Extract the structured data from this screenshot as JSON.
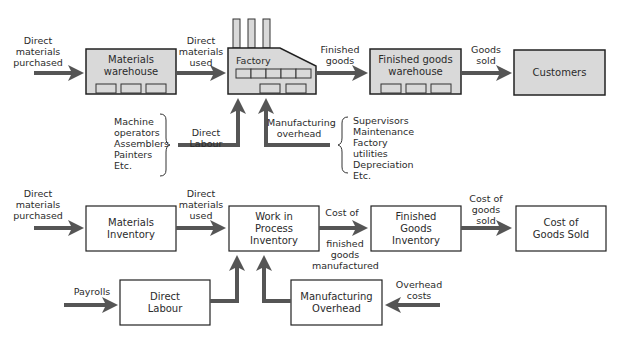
{
  "colors": {
    "arrow": "#555555",
    "box_fill_top": "#d9d9d9",
    "box_stroke": "#222222",
    "box_fill_bottom": "#ffffff"
  },
  "top": {
    "in_label": "Direct\nmaterials\npurchased",
    "materials_warehouse": "Materials\nwarehouse",
    "used_label": "Direct\nmaterials\nused",
    "factory": "Factory",
    "finished_label": "Finished\ngoods",
    "finished_warehouse": "Finished goods\nwarehouse",
    "sold_label": "Goods\nsold",
    "customers": "Customers",
    "labour_items": "Machine\n  operators\nAssemblers\nPainters\nEtc.",
    "direct_labour": "Direct Labour",
    "mfg_overhead": "Manufacturing\noverhead",
    "overhead_items": "Supervisors\nMaintenance\nFactory\n  utilities\nDepreciation\nEtc."
  },
  "bottom": {
    "in_label": "Direct\nmaterials\npurchased",
    "materials_inventory": "Materials\nInventory",
    "used_label": "Direct\nmaterials\nused",
    "wip": "Work in\nProcess\nInventory",
    "cost_of_label": "Cost of",
    "fgm_label": "finished\ngoods\nmanufactured",
    "fg_inventory": "Finished\nGoods\nInventory",
    "cogs_label": "Cost of\ngoods\nsold",
    "cogs_box": "Cost of\nGoods Sold",
    "payrolls": "Payrolls",
    "direct_labour": "Direct\nLabour",
    "mfg_overhead": "Manufacturing\nOverhead",
    "overhead_costs": "Overhead\ncosts"
  }
}
